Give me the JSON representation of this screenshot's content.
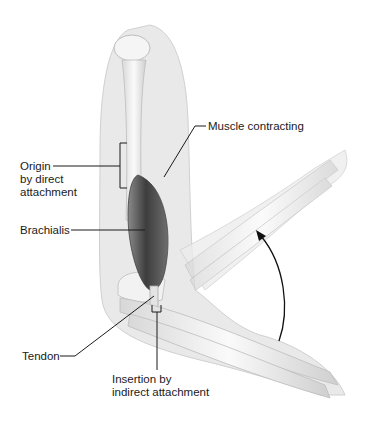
{
  "diagram": {
    "labels": {
      "muscle_contracting": "Muscle contracting",
      "origin_line1": "Origin",
      "origin_line2": "by direct",
      "origin_line3": "attachment",
      "brachialis": "Brachialis",
      "tendon": "Tendon",
      "insertion_line1": "Insertion by",
      "insertion_line2": "indirect attachment"
    },
    "icons": {
      "motion_arrow": "curved-arrow-up"
    },
    "colors": {
      "background": "#ffffff",
      "skin_silhouette": "#e6e6e6",
      "bone": "#f2f2f2",
      "muscle_dark": "#5a5a5a",
      "leader_line": "#1a1a1a"
    }
  }
}
